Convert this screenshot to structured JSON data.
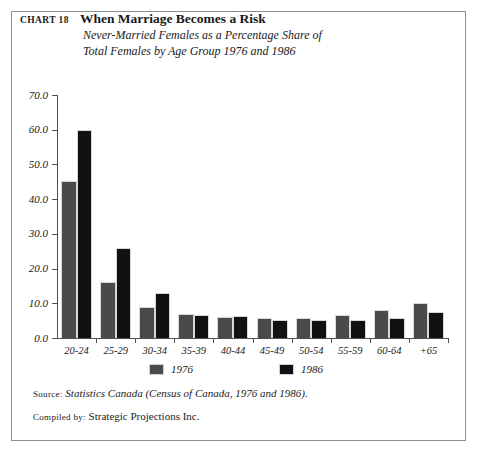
{
  "header": {
    "chart_number": "CHART 18",
    "title": "When Marriage Becomes a Risk",
    "subtitle_line1": "Never-Married Females as a Percentage Share of",
    "subtitle_line2": "Total Females by Age Group 1976 and 1986"
  },
  "notes": {
    "source_key": "Source:",
    "source_value": "Statistics Canada (Census of Canada, 1976 and 1986).",
    "compiled_key": "Compiled by:",
    "compiled_value": "Strategic Projections Inc."
  },
  "colors": {
    "series_1976": "#4a4a4a",
    "series_1986": "#111111",
    "axis": "#4f4f4f",
    "frame": "#8d8d8d",
    "background": "#ffffff"
  },
  "chart_data": {
    "type": "bar",
    "title": "When Marriage Becomes a Risk",
    "subtitle": "Never-Married Females as a Percentage Share of Total Females by Age Group 1976 and 1986",
    "xlabel": "",
    "ylabel": "",
    "ylim": [
      0.0,
      70.0
    ],
    "yticks": [
      0.0,
      10.0,
      20.0,
      30.0,
      40.0,
      50.0,
      60.0,
      70.0
    ],
    "ytick_labels": [
      "0.0",
      "10.0",
      "20.0",
      "30.0",
      "40.0",
      "50.0",
      "60.0",
      "70.0"
    ],
    "grid": false,
    "legend_position": "bottom",
    "categories": [
      "20-24",
      "25-29",
      "30-34",
      "35-39",
      "40-44",
      "45-49",
      "50-54",
      "55-59",
      "60-64",
      "+65"
    ],
    "series": [
      {
        "name": "1976",
        "color": "#4a4a4a",
        "values": [
          45.2,
          16.2,
          9.0,
          6.8,
          6.0,
          5.9,
          5.9,
          6.7,
          8.0,
          10.0
        ]
      },
      {
        "name": "1986",
        "color": "#111111",
        "values": [
          60.0,
          25.8,
          13.0,
          6.7,
          6.2,
          5.3,
          5.2,
          5.3,
          5.9,
          7.5
        ]
      }
    ]
  }
}
